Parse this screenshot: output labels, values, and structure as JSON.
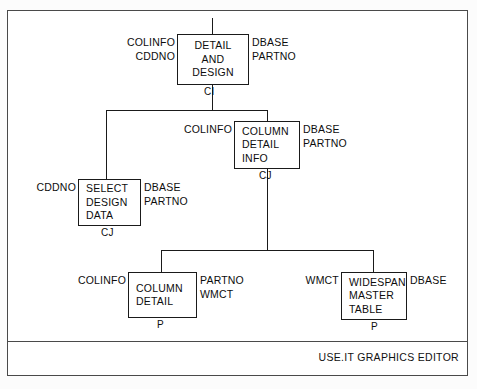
{
  "diagram": {
    "title": "USE.IT GRAPHICS EDITOR",
    "footer_label": "USE.IT GRAPHICS EDITOR",
    "nodes": [
      {
        "id": "detail-and-design",
        "lines": [
          "DETAIL",
          "AND",
          "DESIGN"
        ],
        "inputs": [
          "COLINFO",
          "CDDNO"
        ],
        "outputs": [
          "DBASE",
          "PARTNO"
        ],
        "control": "CI"
      },
      {
        "id": "column-detail-info",
        "lines": [
          "COLUMN",
          "DETAIL",
          "INFO"
        ],
        "inputs": [
          "COLINFO"
        ],
        "outputs": [
          "DBASE",
          "PARTNO"
        ],
        "control": "CJ"
      },
      {
        "id": "select-design-data",
        "lines": [
          "SELECT",
          "DESIGN",
          "DATA"
        ],
        "inputs": [
          "CDDNO"
        ],
        "outputs": [
          "DBASE",
          "PARTNO"
        ],
        "control": "CJ"
      },
      {
        "id": "column-detail",
        "lines": [
          "COLUMN",
          "DETAIL"
        ],
        "inputs": [
          "COLINFO"
        ],
        "outputs": [
          "PARTNO",
          "WMCT"
        ],
        "control": "P"
      },
      {
        "id": "widespan-master-table",
        "lines": [
          "WIDESPAN",
          "MASTER",
          "TABLE"
        ],
        "inputs": [
          "WMCT"
        ],
        "outputs": [
          "DBASE"
        ],
        "control": "P"
      }
    ],
    "colors": {
      "line": "#1a1a1a",
      "frame": "#4a4a4a",
      "text": "#0d0d0d",
      "background": "#ffffff"
    }
  }
}
